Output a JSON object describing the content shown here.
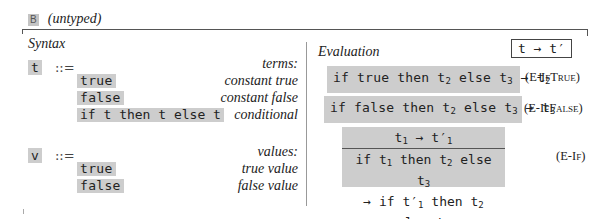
{
  "header": {
    "badge": "B",
    "title": "(untyped)"
  },
  "syntax": {
    "title": "Syntax",
    "groups": [
      {
        "symbol": "t",
        "op": "::=",
        "category": "terms:",
        "productions": [
          {
            "term": "true",
            "desc": "constant true"
          },
          {
            "term": "false",
            "desc": "constant false"
          },
          {
            "term": "if t then t else t",
            "desc": "conditional"
          }
        ]
      },
      {
        "symbol": "v",
        "op": "::=",
        "category": "values:",
        "productions": [
          {
            "term": "true",
            "desc": "true value"
          },
          {
            "term": "false",
            "desc": "false value"
          }
        ]
      }
    ]
  },
  "evaluation": {
    "title": "Evaluation",
    "judgement": "t → t′",
    "rules": [
      {
        "name_prefix": "(E-",
        "name_sc": "IfTrue",
        "name_suffix": ")",
        "body": "if true then t₂ else t₃ → t₂"
      },
      {
        "name_prefix": "(E-",
        "name_sc": "IfFalse",
        "name_suffix": ")",
        "body": "if false then t₂ else t₃ → t₃"
      },
      {
        "name_prefix": "(E-",
        "name_sc": "If",
        "name_suffix": ")",
        "premise": "t₁ → t′₁",
        "conclusion_1": "if t₁ then t₂ else t₃",
        "conclusion_2": "→ if t′₁ then t₂ else t₃"
      }
    ]
  },
  "colors": {
    "highlight": "#cdcdcd",
    "rule_line": "#555555",
    "divider": "#999999"
  }
}
